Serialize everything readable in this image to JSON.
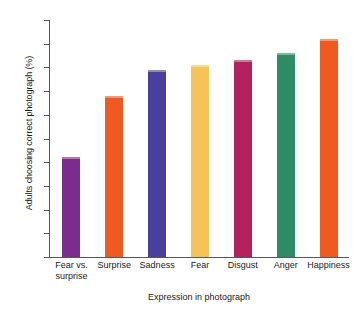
{
  "chart_data": {
    "type": "bar",
    "title": "",
    "xlabel": "Expression in photograph",
    "ylabel": "Adults choosing correct photograph (%)",
    "categories": [
      "Fear vs. surprise",
      "Surprise",
      "Sadness",
      "Fear",
      "Disgust",
      "Anger",
      "Happiness"
    ],
    "category_lines": [
      [
        "Fear vs.",
        "surprise"
      ],
      [
        "Surprise",
        ""
      ],
      [
        "Sadness",
        ""
      ],
      [
        "Fear",
        ""
      ],
      [
        "Disgust",
        ""
      ],
      [
        "Anger",
        ""
      ],
      [
        "Happiness",
        ""
      ]
    ],
    "values": [
      42,
      68,
      79,
      81,
      83,
      86,
      92
    ],
    "bar_colors": [
      "#7B2D8E",
      "#F05A20",
      "#4B3F9E",
      "#F6C358",
      "#B4215C",
      "#2E8B63",
      "#F05A20"
    ],
    "ylim": [
      0,
      100
    ],
    "yticks": [
      0,
      10,
      20,
      30,
      40,
      50,
      60,
      70,
      80,
      90,
      100
    ],
    "ytick_labels": [
      "0",
      "10",
      "20",
      "30",
      "40",
      "50",
      "60",
      "70",
      "80",
      "90",
      "100"
    ],
    "grid": false,
    "legend": "none",
    "axis_color": "#58585a"
  }
}
